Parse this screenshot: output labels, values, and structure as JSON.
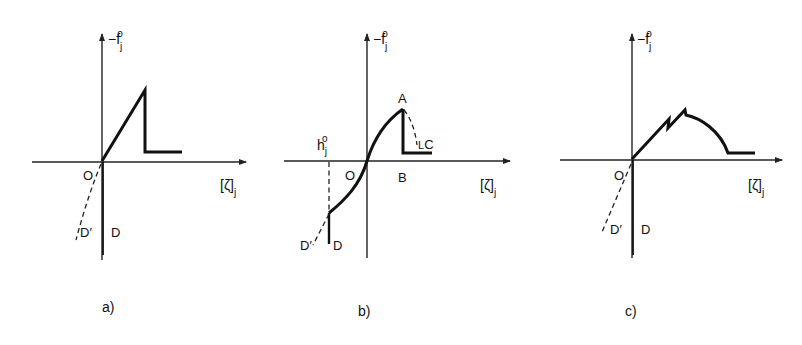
{
  "figure": {
    "y_axis_label": "−f",
    "y_axis_sub": "j",
    "y_axis_sup": "o",
    "x_axis_label": "[ζ]",
    "x_axis_sub": "j",
    "panels": [
      {
        "id": "a",
        "caption": "a)",
        "origin_label": "O",
        "dashed_branch_label": "D′",
        "vertical_branch_label": "D",
        "shape": "linear rise to peak, vertical drop, horizontal residual plateau"
      },
      {
        "id": "b",
        "caption": "b)",
        "origin_label": "O",
        "peak_label": "A",
        "drop_foot_label": "B",
        "softening_label": "C",
        "offset_label": "h",
        "offset_sub": "j",
        "offset_sup": "o",
        "dashed_branch_label": "D′",
        "vertical_branch_label": "D",
        "shape": "nonlinear S-curve through origin, peak A, vertical drop to B, dashed softening to C, horizontal plateau"
      },
      {
        "id": "c",
        "caption": "c)",
        "origin_label": "O",
        "dashed_branch_label": "D′",
        "vertical_branch_label": "D",
        "shape": "linear rise with two saw-tooth drops, curved softening, horizontal residual plateau"
      }
    ]
  }
}
